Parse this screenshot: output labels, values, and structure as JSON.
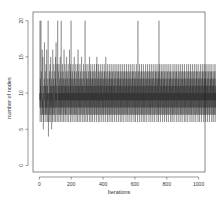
{
  "chart_data": {
    "type": "line",
    "title": "",
    "xlabel": "Iterations",
    "ylabel": "number of nodes",
    "xlim": [
      -40,
      1040
    ],
    "ylim": [
      -0.9,
      21.2
    ],
    "xticks": [
      0,
      200,
      400,
      600,
      800,
      1000
    ],
    "yticks": [
      0,
      5,
      10,
      15,
      20
    ],
    "grid": false,
    "legend": "none",
    "series": [
      {
        "name": "number of nodes",
        "color": "#1a1a1a",
        "x_start": 1,
        "x_step": 1,
        "encoding": "base36-per-char",
        "values": "8a9k6c8b7k9dc6a88g798f7b5a968c9ha7b8d79b6e8a7g98c6b9a7k84a96c8d7a9e6b8f79a8c5b9d7a6g8b97c8ea69b7d8a9f6c8h7a9b8e69ck7a8d9b6e7a8c9b7f6a8d9k7b8c6a9e8b7d9a6c8g7b9a8e6c7b9d8a7f9b6c8a9d7e8b6a9c8g7a9b8d6e7k9a8c7b6d9a8e7c9b8a6f7d9a8c7b9e6a8d7b9c8a6e9g7b8d9a6c8b7e9a8d6c7b9f8a7c9b6d8a9e7b8c6a9d7k8b9a6e8c7d9b8a6c9e7b8d9a7c6f8b9a7d8e6c9b7a8d9c6e8b7a9d8c7b6e9a8d7c9b8a6e7f9b8c7a9d6e8b7c9a8d6b7e9c8a7d9b6c8e7a9d8b7c6a9e8d7b9c8a6f7d9b8c7a9e6b8d7c9a8b6e7d9c8a7b9d6e8c7b9a8d6c7e9b8a7d9c6b8e7a9d8c7b6a9e8d7c9b8a6d7e9c8b7a9d6c8e7b9a8d6c7b9e8a7d9c6b8a7e9d8c7b9a6d8e7c9b8a7d6c9e8b7a9d8c6b7e9a8d7c9b6a8e7d9c8b7a9d6e8c7b9a8d6c7b9e8a7d9c6b8k7a9d8c7b6e9a8d7c9b8a6e7d9c8b7a9d6e8c7b9a8d6c7b9e8a7d9c6b8a7e9d8c7b9a6d8e7c9b8a7d6c9e8b7a9d8c6b7e9a8d7c9b6a8e7d9c8b7a9d6e8c7b9a8d6c7k9e8a7d9c6b8a7e9d8c7b9a6d8e7c9b8a7d6c9e8b7a9d8c6b7e9a8d7c9b6a8e7d9c8b7a9d6e8c7b9a8d6c7b9e8a7d9c6b8a7e9d8c7b9a6d8e7c9b8a7d6c9e8b7a9d8c6b7e9a8d7c9b6a8e7d9c8b7a9d6e8c7b9a8d6c7b9e8a7d9c6b8a7e9d8c7b9a6d8e7c9b8a7d6c9e8b7a9d8c6b7e9a8d7c9b6a8e7d9c8b7a9d6e8c7b9a8d6c7b9e8a7d9c6b8a7e9d8c7b9a6d8e7c9b8a7d6c9e8b7a9d8c6b7e9a8d7c9b6a8e7d9c8b7a9d6e8c7b9a8d6c7b9e8a7d9c6b8a7e9d8c7b9a6d8e7c9b8a7d6c9e8b7a9d8c6b7e9a8d7c9b6a8e7d9c8b7a9d6e8c7b9a8d6c7b9e8a7d9c6b8a7e9d8c7b9a6d8e7c9b8a7d6c9e8b7a9d8c6b7e9a8d7c9b6a8e7d9c8b7a9d6e8c7b9a8d6c7b9e8a7d9c6b8a7e9d8c7b9a6d8e7c9b8a7d6c9e8b7a9d8c6b7e9a8d7c9b6a8e7d9c8b7a9d6e8c7b9a8d6c7b9e8a7d9c6b8a7e9d8c7b9a6d8e7c9b8a7d6c9e8b7a9d8c6b7e9a8d7c9b6a8e7d9c8b7a9d6e8c7b9a8d6c7b9e8a7d9c6b8a7e9d8c7b9a6"
      }
    ]
  }
}
